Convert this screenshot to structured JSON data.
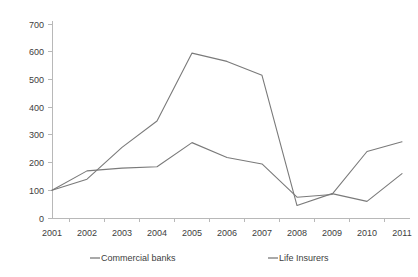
{
  "chart_data": {
    "type": "line",
    "title": "",
    "xlabel": "",
    "ylabel": "",
    "categories": [
      "2001",
      "2002",
      "2003",
      "2004",
      "2005",
      "2006",
      "2007",
      "2008",
      "2009",
      "2010",
      "2011"
    ],
    "series": [
      {
        "name": "Commercial banks",
        "values": [
          100,
          170,
          180,
          185,
          272,
          218,
          195,
          75,
          85,
          240,
          275
        ],
        "color": "#7a7a7a"
      },
      {
        "name": "Life Insurers",
        "values": [
          100,
          140,
          255,
          350,
          595,
          565,
          515,
          45,
          88,
          60,
          160
        ],
        "color": "#7a7a7a"
      }
    ],
    "ylim": [
      0,
      700
    ],
    "y_ticks": [
      "0",
      "100",
      "200",
      "300",
      "400",
      "500",
      "600",
      "700"
    ],
    "y_tick_values": [
      0,
      100,
      200,
      300,
      400,
      500,
      600,
      700
    ],
    "grid": false,
    "legend_position": "bottom"
  },
  "legend": {
    "items": [
      {
        "label": "Commercial banks"
      },
      {
        "label": "Life Insurers"
      }
    ]
  },
  "axes": {
    "y_axis_name": "value-axis",
    "x_axis_name": "year-axis"
  }
}
